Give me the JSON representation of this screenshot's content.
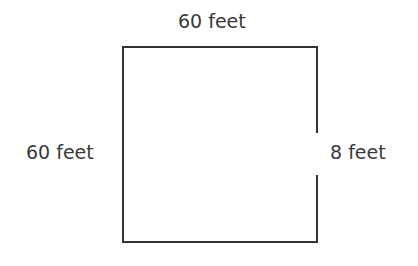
{
  "figure": {
    "type": "geometry-diagram",
    "shape": "square-with-gap",
    "background_color": "#ffffff",
    "stroke_color": "#333333",
    "stroke_width": 2,
    "text_color": "#3a3a3a",
    "square": {
      "left": 122,
      "top": 46,
      "right": 318,
      "bottom": 243,
      "width": 196,
      "height": 197
    },
    "gap": {
      "side": "right",
      "start_y": 133,
      "end_y": 175,
      "length_px": 42
    },
    "labels": {
      "top": "60 feet",
      "left": "60 feet",
      "right": "8 feet"
    },
    "measurements": [
      {
        "side": "top",
        "value": 60,
        "unit": "feet",
        "text": "60 feet"
      },
      {
        "side": "left",
        "value": 60,
        "unit": "feet",
        "text": "60 feet"
      },
      {
        "side": "right-gap",
        "value": 8,
        "unit": "feet",
        "text": "8 feet"
      }
    ]
  }
}
